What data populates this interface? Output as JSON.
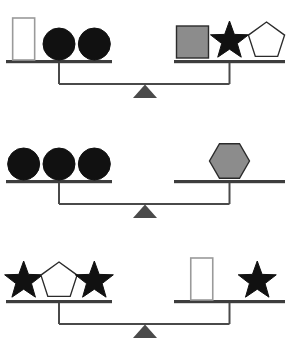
{
  "diagram": {
    "type": "balance-scales",
    "background_color": "#ffffff",
    "palette": {
      "black_fill": "#111111",
      "gray_fill": "#8c8c8c",
      "white_fill": "#ffffff",
      "shape_outline_dark": "#2b2b2b",
      "shape_outline_gray": "#9a9a9a",
      "beam_color": "#4a4a4a",
      "pan_color": "#3d3d3d",
      "fulcrum_color": "#4a4a4a"
    },
    "balances": [
      {
        "id": "balance-1",
        "state": "level",
        "left_pan": {
          "items": [
            {
              "shape": "rectangle",
              "fill": "white",
              "outline": "gray"
            },
            {
              "shape": "circle",
              "fill": "black",
              "outline": "black"
            },
            {
              "shape": "circle",
              "fill": "black",
              "outline": "black"
            }
          ]
        },
        "right_pan": {
          "items": [
            {
              "shape": "square",
              "fill": "gray",
              "outline": "dark"
            },
            {
              "shape": "star",
              "fill": "black",
              "outline": "black"
            },
            {
              "shape": "pentagon",
              "fill": "white",
              "outline": "dark"
            }
          ]
        }
      },
      {
        "id": "balance-2",
        "state": "level",
        "left_pan": {
          "items": [
            {
              "shape": "circle",
              "fill": "black",
              "outline": "black"
            },
            {
              "shape": "circle",
              "fill": "black",
              "outline": "black"
            },
            {
              "shape": "circle",
              "fill": "black",
              "outline": "black"
            }
          ]
        },
        "right_pan": {
          "items": [
            {
              "shape": "hexagon",
              "fill": "gray",
              "outline": "dark"
            }
          ]
        }
      },
      {
        "id": "balance-3",
        "state": "level",
        "left_pan": {
          "items": [
            {
              "shape": "star",
              "fill": "black",
              "outline": "black"
            },
            {
              "shape": "pentagon",
              "fill": "white",
              "outline": "dark"
            },
            {
              "shape": "star",
              "fill": "black",
              "outline": "black"
            }
          ]
        },
        "right_pan": {
          "items": [
            {
              "shape": "rectangle",
              "fill": "white",
              "outline": "gray"
            },
            {
              "shape": "star",
              "fill": "black",
              "outline": "black"
            }
          ]
        }
      }
    ]
  }
}
